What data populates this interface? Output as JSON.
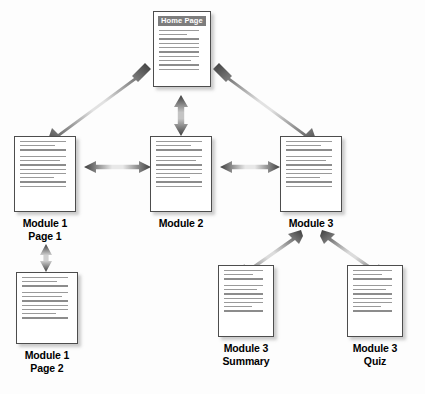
{
  "diagram": {
    "background_color": "#fdfdfd",
    "arrow_color_dark": "#3c3c3c",
    "arrow_color_light": "#d8d8d8",
    "doc_border_color": "#4d4d4d",
    "doc_fill_color": "#ffffff",
    "header_bar_color": "#7d7d7d",
    "header_text_color": "#ffffff",
    "line_color": "#9a9a9a",
    "label_color": "#000000"
  },
  "nodes": [
    {
      "id": "home-page",
      "label": "",
      "label_lines": [],
      "header": "Home Page",
      "has_header": true,
      "x": 153,
      "y": 11,
      "w": 58,
      "h": 76,
      "lines": [
        88,
        60,
        88,
        88,
        88,
        88,
        88,
        70,
        88,
        88
      ]
    },
    {
      "id": "module-1-page-1",
      "label": "Module 1 Page 1",
      "label_lines": [
        "Module 1",
        "Page 1"
      ],
      "header": "",
      "has_header": false,
      "x": 14,
      "y": 136,
      "w": 62,
      "h": 76,
      "lines": [
        92,
        70,
        92,
        92,
        80,
        92,
        92,
        92,
        68,
        92,
        92
      ]
    },
    {
      "id": "module-2",
      "label": "Module 2",
      "label_lines": [
        "Module 2"
      ],
      "header": "",
      "has_header": false,
      "x": 150,
      "y": 136,
      "w": 62,
      "h": 76,
      "lines": [
        92,
        70,
        92,
        92,
        80,
        92,
        92,
        92,
        68,
        92,
        92
      ]
    },
    {
      "id": "module-3",
      "label": "Module 3",
      "label_lines": [
        "Module 3"
      ],
      "header": "",
      "has_header": false,
      "x": 280,
      "y": 136,
      "w": 62,
      "h": 76,
      "lines": [
        92,
        70,
        92,
        92,
        80,
        92,
        92,
        92,
        68,
        92,
        92
      ]
    },
    {
      "id": "module-1-page-2",
      "label": "Module 1 Page 2",
      "label_lines": [
        "Module 1",
        "Page 2"
      ],
      "header": "",
      "has_header": false,
      "x": 16,
      "y": 272,
      "w": 62,
      "h": 72,
      "lines": [
        92,
        70,
        92,
        92,
        80,
        92,
        92,
        92,
        68,
        92
      ]
    },
    {
      "id": "module-3-summary",
      "label": "Module 3 Summary",
      "label_lines": [
        "Module 3",
        "Summary"
      ],
      "header": "",
      "has_header": false,
      "x": 218,
      "y": 265,
      "w": 56,
      "h": 72,
      "lines": [
        88,
        66,
        88,
        88,
        76,
        88,
        88,
        88,
        64,
        88
      ]
    },
    {
      "id": "module-3-quiz",
      "label": "Module 3 Quiz",
      "label_lines": [
        "Module 3",
        "Quiz"
      ],
      "header": "",
      "has_header": false,
      "x": 347,
      "y": 265,
      "w": 56,
      "h": 72,
      "lines": [
        88,
        66,
        88,
        88,
        76,
        88,
        88,
        88,
        64,
        88
      ]
    }
  ],
  "connections": [
    {
      "id": "home-to-module-1",
      "from": "home-page",
      "to": "module-1-page-1",
      "style": "double-headed",
      "orientation": "diagonal"
    },
    {
      "id": "home-to-module-2",
      "from": "home-page",
      "to": "module-2",
      "style": "double-headed",
      "orientation": "vertical"
    },
    {
      "id": "home-to-module-3",
      "from": "home-page",
      "to": "module-3",
      "style": "double-headed",
      "orientation": "diagonal"
    },
    {
      "id": "module-1-to-module-2",
      "from": "module-1-page-1",
      "to": "module-2",
      "style": "double-headed",
      "orientation": "horizontal"
    },
    {
      "id": "module-2-to-module-3",
      "from": "module-2",
      "to": "module-3",
      "style": "double-headed",
      "orientation": "horizontal"
    },
    {
      "id": "module-1-page-1-to-page-2",
      "from": "module-1-page-1",
      "to": "module-1-page-2",
      "style": "double-headed",
      "orientation": "vertical"
    },
    {
      "id": "module-3-to-summary",
      "from": "module-3",
      "to": "module-3-summary",
      "style": "double-headed",
      "orientation": "diagonal"
    },
    {
      "id": "module-3-to-quiz",
      "from": "module-3",
      "to": "module-3-quiz",
      "style": "double-headed",
      "orientation": "diagonal"
    }
  ]
}
